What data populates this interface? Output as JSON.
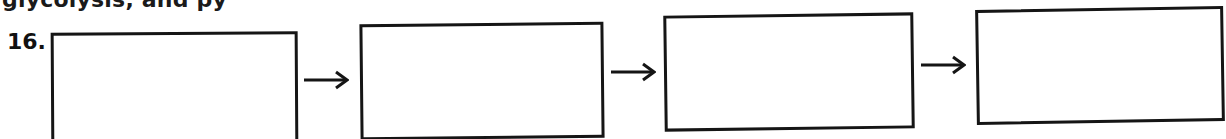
{
  "header": {
    "clipped_text": "glycolysis, and py"
  },
  "question": {
    "number": "16."
  },
  "flow": {
    "boxes": [
      {
        "id": 1,
        "value": ""
      },
      {
        "id": 2,
        "value": ""
      },
      {
        "id": 3,
        "value": ""
      },
      {
        "id": 4,
        "value": ""
      }
    ],
    "arrows": [
      {
        "icon": "right-arrow-icon"
      },
      {
        "icon": "right-arrow-icon"
      },
      {
        "icon": "right-arrow-icon"
      }
    ]
  },
  "colors": {
    "ink": "#151515",
    "paper": "#ffffff"
  }
}
